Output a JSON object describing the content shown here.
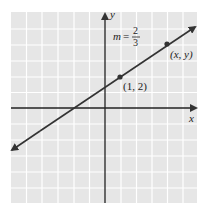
{
  "figure": {
    "axes": {
      "x_label": "x",
      "y_label": "y"
    },
    "slope_label": {
      "prefix": "m =",
      "numerator": "2",
      "denominator": "3"
    },
    "points": [
      {
        "label": "(1, 2)"
      },
      {
        "label": "(x, y)"
      }
    ],
    "colors": {
      "grid_bg": "#e6e6e6",
      "grid_line": "#ffffff",
      "line": "#333333",
      "axis": "#222222"
    }
  }
}
